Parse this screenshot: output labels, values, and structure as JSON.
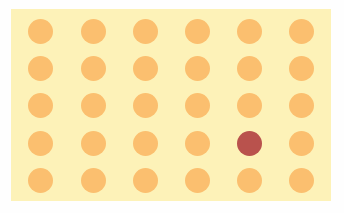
{
  "board": {
    "rows": 5,
    "cols": 6,
    "background_color": "#fdf2b8",
    "dot_color": "#fbbf6f",
    "target_color": "#b9524d",
    "target": {
      "row": 4,
      "col": 5
    },
    "col_centers": [
      29,
      82,
      134,
      186,
      238,
      290
    ],
    "row_centers": [
      22,
      59,
      96,
      134,
      171
    ]
  }
}
